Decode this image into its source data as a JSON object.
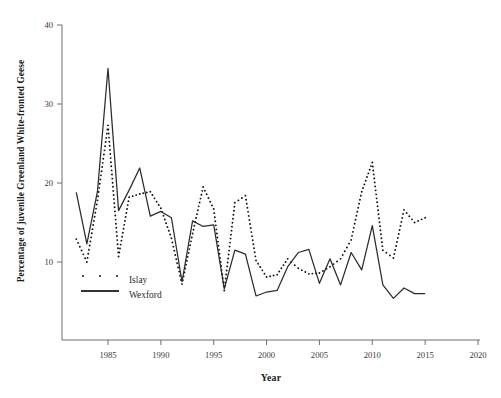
{
  "chart_data": {
    "type": "line",
    "title": "",
    "xlabel": "Year",
    "ylabel": "Percentage of juvenile Greenland White-fronted Geese",
    "xlim": [
      1981.0,
      2021.5
    ],
    "ylim": [
      2.0,
      40.0
    ],
    "xticks": [
      1985,
      1990,
      1995,
      2000,
      2005,
      2010,
      2015,
      2020
    ],
    "yticks": [
      10,
      20,
      30,
      40
    ],
    "grid": false,
    "legend_position": "lower-left inside axes",
    "x": [
      1982,
      1983,
      1984,
      1985,
      1986,
      1987,
      1988,
      1989,
      1990,
      1991,
      1992,
      1993,
      1994,
      1995,
      1996,
      1997,
      1998,
      1999,
      2000,
      2001,
      2002,
      2003,
      2004,
      2005,
      2006,
      2007,
      2008,
      2009,
      2010,
      2011,
      2012,
      2013,
      2014,
      2015
    ],
    "series": [
      {
        "name": "Islay",
        "marker": "dotted",
        "style": "dotted",
        "color": "#111111",
        "values": [
          12.9,
          10.0,
          17.8,
          27.3,
          10.7,
          18.2,
          18.6,
          18.9,
          16.8,
          13.0,
          7.2,
          13.6,
          19.5,
          16.7,
          6.4,
          17.5,
          18.4,
          10.2,
          8.1,
          8.4,
          10.4,
          9.2,
          8.5,
          8.6,
          9.4,
          10.4,
          12.8,
          18.9,
          22.6,
          11.5,
          10.5,
          16.6,
          15.0,
          15.6
        ]
      },
      {
        "name": "Wexford",
        "marker": "none",
        "style": "solid",
        "color": "#2b2b2b",
        "values": [
          18.8,
          12.3,
          18.9,
          34.5,
          16.5,
          19.1,
          21.9,
          15.8,
          16.4,
          15.6,
          7.5,
          15.2,
          14.5,
          14.7,
          6.6,
          11.5,
          11.0,
          5.7,
          6.2,
          6.4,
          9.4,
          11.2,
          11.6,
          7.3,
          10.4,
          7.1,
          11.2,
          9.0,
          14.6,
          7.1,
          5.4,
          6.7,
          6.0,
          6.0
        ]
      }
    ]
  },
  "axis": {
    "y_tick_labels": [
      "40",
      "30",
      "20",
      "10"
    ],
    "x_tick_labels": [
      "1985",
      "1990",
      "1995",
      "2000",
      "2005",
      "2010",
      "2015",
      "2020"
    ],
    "x_title": "Year",
    "y_title": "Percentage of juvenile Greenland White-fronted Geese"
  },
  "legend": {
    "items": [
      {
        "label": "Islay",
        "key": "dotted-marker-key"
      },
      {
        "label": "Wexford",
        "key": "solid-line-key"
      }
    ]
  }
}
